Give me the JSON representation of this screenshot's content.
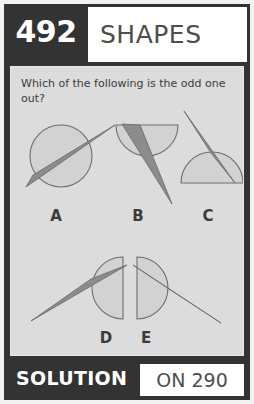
{
  "card": {
    "header": {
      "number": "492",
      "title": "SHAPES"
    },
    "question": {
      "text": "Which of the following is the odd one out?"
    },
    "options": [
      {
        "label": "A",
        "shape_name": "circle-with-wedge",
        "description": "full circle with a thin tapering wedge crossing it, tip pointing up-right"
      },
      {
        "label": "B",
        "shape_name": "semicircle-flat-top-with-wedge",
        "description": "semicircle with flat top edge and a thin tapering wedge, tip pointing down-right"
      },
      {
        "label": "C",
        "shape_name": "semicircle-flat-bottom-with-wedge",
        "description": "semicircle with flat bottom edge and a thin tapering wedge, tip pointing up-left"
      },
      {
        "label": "D",
        "shape_name": "semicircle-flat-right-with-wedge",
        "description": "semicircle with flat right edge and a thin tapering wedge, tip pointing down-left"
      },
      {
        "label": "E",
        "shape_name": "semicircle-flat-left-with-wedge",
        "description": "semicircle with flat left edge and a thin tapering wedge, tip pointing down-right"
      }
    ],
    "footer": {
      "solution_label": "SOLUTION",
      "answer_reference": "ON 290"
    },
    "colors": {
      "dark_bar": "#333333",
      "panel_background": "#dcdcdc",
      "shape_fill": "#d2d2d2",
      "shape_stroke": "#6e6e6e",
      "wedge_fill": "#8c8c8c",
      "text_dark": "#3b3b3b",
      "text_white": "#ffffff"
    }
  }
}
